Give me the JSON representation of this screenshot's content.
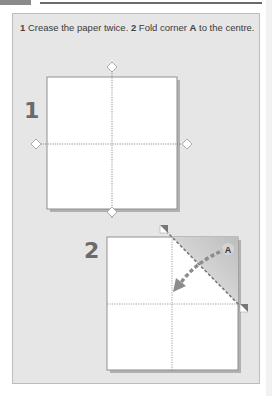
{
  "header": {
    "tab_color": "#8a8a8a",
    "rule_color": "#6a6a6a"
  },
  "caption": {
    "step1_num": "1",
    "step1_text": " Crease the paper twice. ",
    "step2_num": "2",
    "step2_text_a": " Fold corner ",
    "corner_label": "A",
    "step2_text_b": " to the centre."
  },
  "diagram1": {
    "step_number": "1",
    "markers": [
      "crease-marker-top",
      "crease-marker-bottom",
      "crease-marker-left",
      "crease-marker-right"
    ]
  },
  "diagram2": {
    "step_number": "2",
    "corner_label": "A",
    "shaded_color": "#c8c8c8",
    "arrow_color": "#8c8c8c"
  },
  "colors": {
    "panel_bg": "#e6e6e6",
    "paper": "#ffffff",
    "shadow": "#9a9a9a"
  }
}
